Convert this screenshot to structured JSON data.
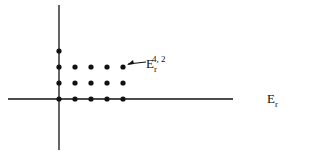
{
  "diagram": {
    "type": "spectral-sequence-page",
    "axes": {
      "vertical": {
        "x": 59,
        "y1": 5,
        "y2": 150
      },
      "horizontal": {
        "y": 99,
        "x1": 8,
        "x2": 233
      }
    },
    "grid": {
      "columns_x": [
        59,
        75,
        91,
        107,
        123
      ],
      "rows_y": [
        99,
        83,
        67,
        51
      ]
    },
    "points": [
      [
        0,
        0
      ],
      [
        1,
        0
      ],
      [
        2,
        0
      ],
      [
        3,
        0
      ],
      [
        4,
        0
      ],
      [
        0,
        1
      ],
      [
        1,
        1
      ],
      [
        2,
        1
      ],
      [
        3,
        1
      ],
      [
        4,
        1
      ],
      [
        0,
        2
      ],
      [
        1,
        2
      ],
      [
        2,
        2
      ],
      [
        3,
        2
      ],
      [
        4,
        2
      ],
      [
        0,
        3
      ]
    ],
    "annotation": {
      "base": "E",
      "subscript": "r",
      "superscript": "4, 2",
      "points_to": [
        4,
        2
      ]
    },
    "page_label": {
      "base": "E",
      "subscript": "r"
    }
  }
}
